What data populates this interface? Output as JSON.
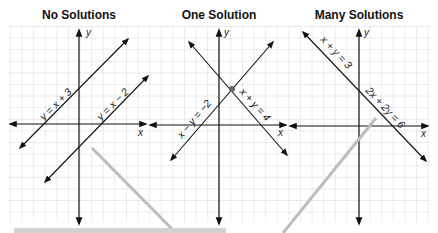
{
  "panels": [
    {
      "title": "No Solutions",
      "equations": [
        "y = x + 3",
        "y = x − 2"
      ],
      "x_axis": "x",
      "y_axis": "y"
    },
    {
      "title": "One Solution",
      "equations": [
        "x − y = −2",
        "x + y = 4"
      ],
      "x_axis": "x",
      "y_axis": "y"
    },
    {
      "title": "Many Solutions",
      "equations": [
        "x + y = 3",
        "2x + 2y = 6"
      ],
      "x_axis": "x",
      "y_axis": "y"
    }
  ],
  "colors": {
    "grid": "#cfcfcf",
    "line": "#111111",
    "overlay": "#bdbdbd"
  }
}
